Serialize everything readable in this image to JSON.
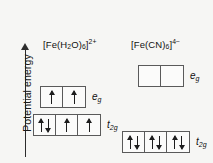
{
  "figure": {
    "axis": {
      "label": "Potential energy",
      "arrow_icon": "up-arrow-icon",
      "direction": "up"
    },
    "complexes": [
      {
        "id": "aqua",
        "title_html": "[Fe(H2O)6]2+",
        "title_parts": {
          "prefix": "[Fe(H",
          "sub1": "2",
          "mid": "O)",
          "sub2": "6",
          "suffix": "]",
          "charge": "2+"
        },
        "field_strength": "weak-field high-spin",
        "levels": [
          {
            "name": "eg",
            "label_main": "e",
            "label_sub": "g",
            "boxes": [
              {
                "spins": [
                  "up"
                ]
              },
              {
                "spins": [
                  "up"
                ]
              }
            ]
          },
          {
            "name": "t2g",
            "label_main": "t",
            "label_sub": "2g",
            "boxes": [
              {
                "spins": [
                  "up",
                  "down"
                ]
              },
              {
                "spins": [
                  "up"
                ]
              },
              {
                "spins": [
                  "up"
                ]
              }
            ]
          }
        ]
      },
      {
        "id": "cyano",
        "title_html": "[Fe(CN)6]4-",
        "title_parts": {
          "prefix": "[Fe(CN)",
          "sub1": "6",
          "mid": "",
          "sub2": "",
          "suffix": "]",
          "charge": "4−"
        },
        "field_strength": "strong-field low-spin",
        "levels": [
          {
            "name": "eg",
            "label_main": "e",
            "label_sub": "g",
            "boxes": [
              {
                "spins": []
              },
              {
                "spins": []
              }
            ]
          },
          {
            "name": "t2g",
            "label_main": "t",
            "label_sub": "2g",
            "boxes": [
              {
                "spins": [
                  "up",
                  "down"
                ]
              },
              {
                "spins": [
                  "up",
                  "down"
                ]
              },
              {
                "spins": [
                  "up",
                  "down"
                ]
              }
            ]
          }
        ]
      }
    ],
    "colors": {
      "background": "#f6f6f4",
      "box_border": "#5a5a5a",
      "box_fill": "#fbfbfa",
      "ink": "#1a1a1a"
    }
  }
}
